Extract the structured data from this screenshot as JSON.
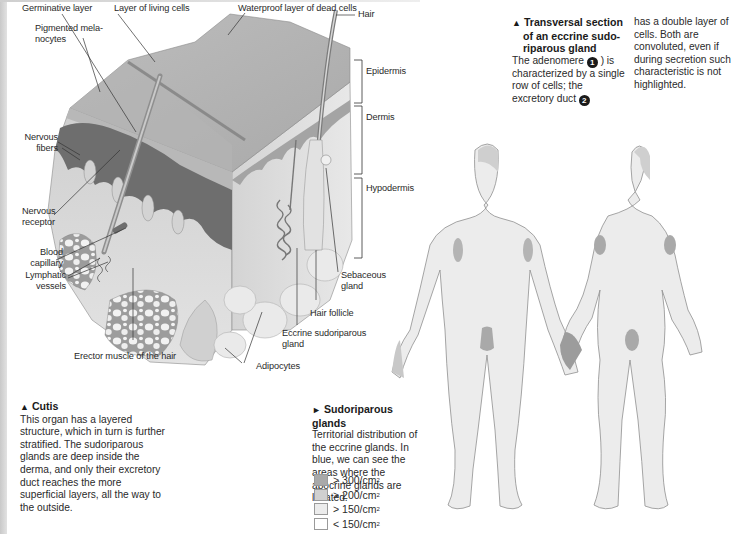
{
  "skin_diagram": {
    "labels": {
      "germinative_layer": "Germinative layer",
      "layer_living_cells": "Layer of living cells",
      "waterproof_layer": "Waterproof layer of dead cells",
      "pigmented_melanocytes_1": "Pigmented mela-",
      "pigmented_melanocytes_2": "nocytes",
      "hair": "Hair",
      "epidermis": "Epidermis",
      "dermis": "Dermis",
      "hypodermis": "Hypodermis",
      "nervous_fibers_1": "Nervous",
      "nervous_fibers_2": "fibers",
      "nervous_receptor_1": "Nervous",
      "nervous_receptor_2": "receptor",
      "blood_capillary_1": "Blood",
      "blood_capillary_2": "capillary",
      "lymphatic_vessels_1": "Lymphatic",
      "lymphatic_vessels_2": "vessels",
      "sebaceous_gland_1": "Sebaceous",
      "sebaceous_gland_2": "gland",
      "hair_follicle": "Hair follicle",
      "eccrine_gland_1": "Eccrine sudoriparous",
      "eccrine_gland_2": "gland",
      "adipocytes": "Adipocytes",
      "erector_muscle": "Erector muscle of the hair"
    }
  },
  "cutis_caption": {
    "marker": "▲",
    "title": "Cutis",
    "body": "This organ has a layered structure, which in turn is further stratified. The sudoriparous glands are deep inside the derma, and only their excretory duct reaches the more superficial layers, all the way to the outside."
  },
  "transversal_caption": {
    "marker": "▲",
    "title_1": "Transversal section",
    "title_2": "of an eccrine sudo-",
    "title_3": "riparous gland",
    "text_a": "The adenomere",
    "num_1": "1",
    "text_b": ") is characterized by a single row of cells; the excretory duct",
    "num_2": "2",
    "text_c": "has a double layer of cells. Both are convoluted, even if during secretion such characteristic is not highlighted."
  },
  "sudoriparous_caption": {
    "marker": "►",
    "title": "Sudoriparous glands",
    "body": "Territorial distribution of the eccrine glands. In blue, we can see the areas where the apocrine glands are located."
  },
  "legend": {
    "items": [
      {
        "label": "> 300/cm",
        "sup": "2",
        "color": "#a9a9a9"
      },
      {
        "label": "> 200/cm",
        "sup": "2",
        "color": "#d0d0d0"
      },
      {
        "label": "> 150/cm",
        "sup": "2",
        "color": "#ececec"
      },
      {
        "label": "< 150/cm",
        "sup": "2",
        "color": "#ffffff"
      }
    ]
  },
  "colors": {
    "body_fill": "#ececec",
    "body_outline": "#9a9a9a",
    "dense_area": "#a9a9a9",
    "medium_area": "#cfcfcf",
    "epidermis_top": "#c4c4c4",
    "dermis": "#d9d9d9",
    "papillae_dark": "#6e6e6e"
  }
}
